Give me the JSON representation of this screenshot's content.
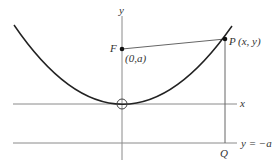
{
  "figure": {
    "labels": {
      "y_axis": "y",
      "x_axis": "x",
      "focus": "F",
      "focus_coords": "(0,a)",
      "point": "P",
      "point_coords": "(x, y)",
      "directrix": "y = −a",
      "foot": "Q"
    },
    "colors": {
      "axis": "#8a8a8a",
      "curve": "#222222",
      "background": "#ffffff"
    }
  }
}
